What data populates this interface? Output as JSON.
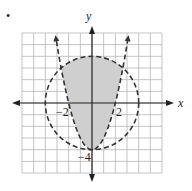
{
  "marker": "•",
  "chart_data": {
    "type": "region-plot",
    "title": "",
    "xlabel": "x",
    "ylabel": "y",
    "xlim": [
      -6,
      6
    ],
    "ylim": [
      -6,
      6
    ],
    "grid": true,
    "tick_labels": {
      "x": [
        "−2",
        "2"
      ],
      "y": [
        "−4"
      ]
    },
    "curves": [
      {
        "name": "circle",
        "equation": "x^2 + y^2 = 16",
        "style": "dashed",
        "center": [
          0,
          0
        ],
        "radius": 4
      },
      {
        "name": "parabola",
        "equation": "y = x^2 - 4",
        "style": "dashed",
        "vertex": [
          0,
          -4
        ]
      }
    ],
    "shaded_region": "y > x^2 - 4 and x^2 + y^2 < 16",
    "colors": {
      "shade": "#cfcfcf",
      "grid": "#b5b5b5",
      "curve": "#333333"
    }
  }
}
